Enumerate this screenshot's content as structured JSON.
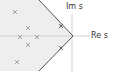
{
  "diagram": {
    "type": "s-plane pole plot",
    "axes": {
      "imag_label": "Im s",
      "real_label": "Re s"
    },
    "region": {
      "description": "shaded stable damping region left of V boundary",
      "fill": "#eeeeee",
      "boundary_color": "#555555"
    },
    "poles": [
      {
        "x": 15,
        "y": 12
      },
      {
        "x": 28,
        "y": 28
      },
      {
        "x": 20,
        "y": 37
      },
      {
        "x": 37,
        "y": 37
      },
      {
        "x": 28,
        "y": 45
      },
      {
        "x": 17,
        "y": 62
      },
      {
        "x": 61,
        "y": 26
      },
      {
        "x": 61,
        "y": 48
      }
    ],
    "pole_marker": "×"
  }
}
